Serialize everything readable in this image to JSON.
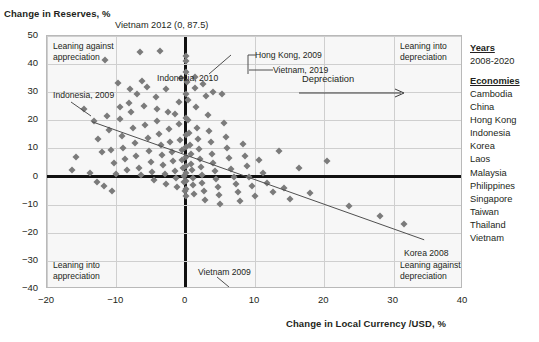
{
  "chart_data": {
    "type": "scatter",
    "title": "",
    "ylabel": "Change in Reserves, %",
    "xlabel": "Change in Local Currency /USD, %",
    "xlim": [
      -20,
      40
    ],
    "ylim": [
      -40,
      50
    ],
    "xticks": [
      -20,
      -10,
      0,
      10,
      20,
      30,
      40
    ],
    "yticks": [
      50,
      40,
      30,
      20,
      10,
      0,
      -10,
      -20,
      -30,
      -40
    ],
    "grid": true,
    "legend_position": "right-outside",
    "series": [
      {
        "name": "Economy-year observations",
        "marker": "diamond",
        "color": "#7b7b7b",
        "points": [
          [
            -14.6,
            24.0
          ],
          [
            -13.2,
            19.6
          ],
          [
            -12.6,
            13.2
          ],
          [
            -12.1,
            8.6
          ],
          [
            -11.6,
            41.5
          ],
          [
            -11.3,
            21.6
          ],
          [
            -11.0,
            16.4
          ],
          [
            -10.7,
            9.4
          ],
          [
            -10.4,
            4.8
          ],
          [
            -10.1,
            1.0
          ],
          [
            -9.8,
            33.2
          ],
          [
            -9.5,
            20.4
          ],
          [
            -9.2,
            14.3
          ],
          [
            -9.0,
            10.2
          ],
          [
            -8.7,
            6.2
          ],
          [
            -8.4,
            2.4
          ],
          [
            -8.1,
            31.0
          ],
          [
            -7.9,
            22.8
          ],
          [
            -7.6,
            17.1
          ],
          [
            -7.3,
            12.0
          ],
          [
            -7.1,
            7.4
          ],
          [
            -6.8,
            3.1
          ],
          [
            -6.5,
            0.4
          ],
          [
            -6.3,
            34.1
          ],
          [
            -6.0,
            25.2
          ],
          [
            -5.8,
            18.2
          ],
          [
            -5.5,
            13.6
          ],
          [
            -5.3,
            9.0
          ],
          [
            -5.0,
            5.2
          ],
          [
            -4.8,
            1.6
          ],
          [
            -4.5,
            -1.2
          ],
          [
            -4.3,
            28.4
          ],
          [
            -4.1,
            19.8
          ],
          [
            -3.9,
            15.0
          ],
          [
            -3.6,
            11.2
          ],
          [
            -3.4,
            7.8
          ],
          [
            -3.2,
            4.0
          ],
          [
            -3.0,
            0.8
          ],
          [
            -2.8,
            -2.6
          ],
          [
            -2.6,
            23.0
          ],
          [
            -2.4,
            16.8
          ],
          [
            -2.2,
            12.4
          ],
          [
            -2.0,
            8.8
          ],
          [
            -1.8,
            5.4
          ],
          [
            -1.6,
            2.0
          ],
          [
            -1.4,
            -0.6
          ],
          [
            -1.2,
            -3.8
          ],
          [
            -1.0,
            26.6
          ],
          [
            -0.9,
            18.6
          ],
          [
            -0.8,
            13.0
          ],
          [
            -0.6,
            9.6
          ],
          [
            -0.5,
            6.0
          ],
          [
            -0.4,
            3.2
          ],
          [
            -0.3,
            0.2
          ],
          [
            -0.2,
            -2.0
          ],
          [
            -0.1,
            -5.2
          ],
          [
            0.0,
            43.0
          ],
          [
            0.0,
            29.5
          ],
          [
            0.0,
            21.0
          ],
          [
            0.0,
            14.8
          ],
          [
            0.0,
            10.6
          ],
          [
            0.0,
            6.8
          ],
          [
            0.0,
            3.6
          ],
          [
            0.0,
            1.2
          ],
          [
            0.0,
            -1.6
          ],
          [
            0.0,
            -4.4
          ],
          [
            0.0,
            -7.0
          ],
          [
            0.2,
            33.8
          ],
          [
            0.3,
            27.2
          ],
          [
            0.4,
            20.0
          ],
          [
            0.5,
            15.6
          ],
          [
            0.6,
            11.4
          ],
          [
            0.7,
            8.0
          ],
          [
            0.8,
            4.6
          ],
          [
            0.9,
            2.2
          ],
          [
            1.0,
            -0.4
          ],
          [
            1.1,
            -3.0
          ],
          [
            1.2,
            -6.2
          ],
          [
            1.4,
            31.4
          ],
          [
            1.5,
            24.6
          ],
          [
            1.6,
            17.4
          ],
          [
            1.8,
            13.4
          ],
          [
            1.9,
            9.8
          ],
          [
            2.0,
            6.4
          ],
          [
            2.2,
            3.4
          ],
          [
            2.3,
            0.6
          ],
          [
            2.4,
            -2.2
          ],
          [
            2.6,
            -5.0
          ],
          [
            2.8,
            -8.4
          ],
          [
            3.0,
            28.8
          ],
          [
            3.2,
            22.0
          ],
          [
            3.4,
            16.2
          ],
          [
            3.6,
            12.2
          ],
          [
            3.8,
            8.2
          ],
          [
            4.0,
            5.0
          ],
          [
            4.2,
            1.8
          ],
          [
            4.4,
            -1.0
          ],
          [
            4.6,
            -3.6
          ],
          [
            4.8,
            -6.6
          ],
          [
            5.0,
            -9.8
          ],
          [
            5.2,
            29.2
          ],
          [
            5.5,
            19.2
          ],
          [
            5.8,
            14.0
          ],
          [
            6.0,
            10.0
          ],
          [
            6.3,
            6.6
          ],
          [
            6.6,
            2.8
          ],
          [
            6.9,
            -0.2
          ],
          [
            7.2,
            -2.8
          ],
          [
            7.5,
            -5.6
          ],
          [
            7.8,
            -8.8
          ],
          [
            8.2,
            11.6
          ],
          [
            8.6,
            7.2
          ],
          [
            8.9,
            3.8
          ],
          [
            9.2,
            0.0
          ],
          [
            9.6,
            -3.4
          ],
          [
            10.0,
            -6.8
          ],
          [
            10.6,
            5.8
          ],
          [
            11.2,
            1.4
          ],
          [
            11.8,
            -2.4
          ],
          [
            12.6,
            -5.4
          ],
          [
            13.4,
            9.2
          ],
          [
            14.2,
            -4.2
          ],
          [
            15.0,
            -8.0
          ],
          [
            16.4,
            3.0
          ],
          [
            18.0,
            -6.0
          ],
          [
            20.4,
            5.6
          ],
          [
            23.6,
            -10.4
          ],
          [
            28.0,
            -14.2
          ],
          [
            31.5,
            -17.0
          ],
          [
            -15.8,
            6.8
          ],
          [
            -16.4,
            2.2
          ],
          [
            -13.8,
            1.4
          ],
          [
            -12.8,
            -1.8
          ],
          [
            -11.8,
            -3.2
          ],
          [
            -10.6,
            -5.0
          ],
          [
            -9.4,
            24.6
          ],
          [
            -8.2,
            26.0
          ],
          [
            -7.0,
            29.2
          ],
          [
            -5.6,
            31.8
          ],
          [
            -4.2,
            24.2
          ],
          [
            -2.9,
            31.2
          ],
          [
            -1.5,
            22.4
          ],
          [
            -0.7,
            35.0
          ],
          [
            0.1,
            37.2
          ],
          [
            1.3,
            35.4
          ],
          [
            2.5,
            33.0
          ],
          [
            3.9,
            30.2
          ],
          [
            -6.6,
            44.2
          ],
          [
            0.0,
            41.0
          ],
          [
            -3.7,
            44.8
          ]
        ]
      }
    ],
    "trendline": {
      "label": "",
      "x_from": -13.5,
      "y_from": 19.5,
      "x_to": 34.4,
      "y_to": -22.5,
      "color": "#4f4f4f"
    },
    "annotations": [
      {
        "id": "vietnam-2012",
        "text": "Vietnam 2012 (0, 87.5)",
        "x": 0,
        "y": 87.5
      },
      {
        "id": "indonesia-2010",
        "text": "Indonesia, 2010",
        "x": -4.8,
        "y": 45.2
      },
      {
        "id": "hong-kong-2009",
        "text": "Hong Kong, 2009",
        "x": 0,
        "y": 43.0
      },
      {
        "id": "vietnam-2019",
        "text": "Vietnam, 2019",
        "x": 0.4,
        "y": 40.8
      },
      {
        "id": "indonesia-2009",
        "text": "Indonesia, 2009",
        "x": -13.8,
        "y": 24.8
      },
      {
        "id": "vietnam-2009",
        "text": "Vietnam 2009",
        "x": 5.6,
        "y": -36.8
      },
      {
        "id": "korea-2008",
        "text": "Korea 2008",
        "x": 34.4,
        "y": -22.5
      }
    ],
    "quadrant_captions": [
      {
        "id": "leaning-against-appreciation",
        "line1": "Leaning against",
        "line2": "appreciation"
      },
      {
        "id": "leaning-into-depreciation",
        "line1": "Leaning into",
        "line2": "depreciation"
      },
      {
        "id": "leaning-into-appreciation",
        "line1": "Leaning into",
        "line2": "appreciation"
      },
      {
        "id": "leaning-against-depreciation",
        "line1": "Leaning against",
        "line2": "depreciation"
      }
    ],
    "direction_arrow": {
      "label": "Depreciation",
      "direction": "right"
    }
  },
  "legend": {
    "years_heading": "Years",
    "years_value": "2008-2020",
    "economies_heading": "Economies",
    "economies": [
      "Cambodia",
      "China",
      "Hong Kong",
      "Indonesia",
      "Korea",
      "Laos",
      "Malaysia",
      "Philippines",
      "Singapore",
      "Taiwan",
      "Thailand",
      "Vietnam"
    ]
  }
}
